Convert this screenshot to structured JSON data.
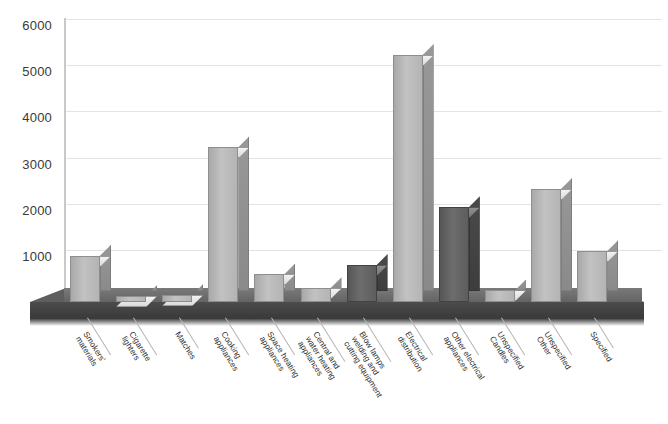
{
  "chart_data": {
    "type": "bar",
    "title": "",
    "subtitle": "",
    "xlabel": "",
    "ylabel": "",
    "ylim": [
      0,
      6000
    ],
    "ytick_values": [
      0,
      1000,
      2000,
      3000,
      4000,
      5000,
      6000
    ],
    "ytick_labels": [
      "0",
      "1000",
      "2000",
      "3000",
      "4000",
      "5000",
      "6000"
    ],
    "grid": true,
    "legend": "none",
    "style": "3d-column",
    "categories": [
      "Smokers' materials",
      "Cigarette lighters",
      "Matches",
      "Cooking appliances",
      "Space heating appliances",
      "Central and water heating appliances",
      "Blow lamps welding and cutting equipment",
      "Electrical distribution",
      "Other electrical appliances",
      "Unspecified Candles",
      "Unspecified Other",
      "Specified"
    ],
    "category_lines": [
      [
        "Smokers'",
        "materials"
      ],
      [
        "Cigarette",
        "lighters"
      ],
      [
        "Matches"
      ],
      [
        "Cooking",
        "appliances"
      ],
      [
        "Space heating",
        "appliances"
      ],
      [
        "Central and",
        "water heating",
        "appliances"
      ],
      [
        "Blow lamps",
        "welding and",
        "cutting equipment"
      ],
      [
        "Electrical",
        "distribution"
      ],
      [
        "Other electrical",
        "appliances"
      ],
      [
        "Unspecified",
        "Candles"
      ],
      [
        "Unspecified",
        "Other"
      ],
      [
        "Specified"
      ]
    ],
    "values": [
      1000,
      120,
      150,
      3350,
      600,
      300,
      800,
      5350,
      2050,
      250,
      2450,
      1100
    ],
    "bar_shades": [
      "light",
      "light",
      "light",
      "light",
      "light",
      "light",
      "dark",
      "light",
      "dark",
      "light",
      "light",
      "light"
    ],
    "colors": {
      "bar_light": "#c2c2c2",
      "bar_dark": "#6d6d6d",
      "bar_top": "#efefef",
      "floor_top": "#6e6e6e",
      "floor_front": "#414141",
      "gridline": "#e3e3e3",
      "axis": "#c9c9c9",
      "text": "#2e2e2e",
      "background": "#ffffff"
    }
  }
}
